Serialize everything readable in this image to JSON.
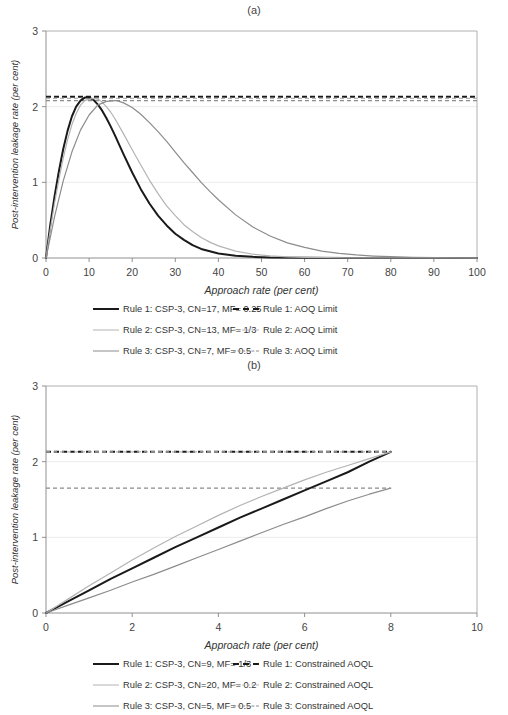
{
  "figure_a": {
    "title": "(a)",
    "chart_data": {
      "type": "line",
      "title": "(a)",
      "xlabel": "Approach rate (per cent)",
      "ylabel": "Post-intervention leakage rate (per cent)",
      "xlim": [
        0,
        100
      ],
      "ylim": [
        0,
        3
      ],
      "xticks": [
        "0",
        "10",
        "20",
        "30",
        "40",
        "50",
        "60",
        "70",
        "80",
        "90",
        "100"
      ],
      "yticks": [
        "0",
        "1",
        "2",
        "3"
      ],
      "grid": "horizontal-major",
      "legend_position": "below",
      "series": [
        {
          "name": "Rule 1: CSP-3, CN=17, MF= 0.25",
          "style": "solid",
          "color": "#1a1a1a",
          "width": 2.0,
          "peak_x": 9.5,
          "peak_y": 2.12,
          "x": [
            0,
            1,
            2,
            3,
            4,
            5,
            6,
            7,
            8,
            9,
            9.5,
            10,
            11,
            12,
            13,
            14,
            15,
            16,
            18,
            20,
            22,
            24,
            26,
            28,
            30,
            32,
            34,
            36,
            38,
            40,
            44,
            48,
            52,
            60,
            70,
            80,
            90,
            100
          ],
          "y": [
            0,
            0.44,
            0.82,
            1.15,
            1.44,
            1.68,
            1.87,
            2.0,
            2.08,
            2.12,
            2.12,
            2.12,
            2.09,
            2.03,
            1.95,
            1.85,
            1.74,
            1.62,
            1.37,
            1.13,
            0.91,
            0.72,
            0.56,
            0.43,
            0.32,
            0.24,
            0.17,
            0.12,
            0.09,
            0.06,
            0.03,
            0.015,
            0.007,
            0.002,
            0.001,
            0.0004,
            0.0002,
            0.0001
          ]
        },
        {
          "name": "Rule 2: CSP-3, CN=13, MF= 1/3",
          "style": "solid",
          "color": "#b3b3b3",
          "width": 1.2,
          "peak_x": 12,
          "peak_y": 2.1,
          "x": [
            0,
            1,
            2,
            3,
            4,
            5,
            6,
            7,
            8,
            9,
            10,
            11,
            12,
            13,
            14,
            15,
            16,
            18,
            20,
            22,
            24,
            26,
            28,
            30,
            32,
            34,
            36,
            38,
            40,
            44,
            48,
            52,
            56,
            60,
            65,
            70,
            80,
            90,
            100
          ],
          "y": [
            0,
            0.38,
            0.73,
            1.04,
            1.32,
            1.56,
            1.76,
            1.91,
            2.02,
            2.08,
            2.1,
            2.11,
            2.1,
            2.06,
            2.0,
            1.93,
            1.84,
            1.64,
            1.43,
            1.23,
            1.03,
            0.85,
            0.69,
            0.56,
            0.44,
            0.35,
            0.27,
            0.21,
            0.16,
            0.09,
            0.05,
            0.027,
            0.014,
            0.008,
            0.004,
            0.002,
            0.0006,
            0.0002,
            0.0001
          ]
        },
        {
          "name": "Rule 3: CSP-3, CN=7, MF= 0.5",
          "style": "solid",
          "color": "#8c8c8c",
          "width": 1.2,
          "peak_x": 16.5,
          "peak_y": 2.08,
          "x": [
            0,
            2,
            4,
            6,
            8,
            10,
            12,
            14,
            16,
            16.5,
            18,
            20,
            22,
            24,
            26,
            28,
            30,
            32,
            34,
            36,
            38,
            40,
            44,
            48,
            52,
            56,
            60,
            64,
            68,
            72,
            76,
            80,
            85,
            90,
            95,
            100
          ],
          "y": [
            0,
            0.55,
            1.02,
            1.4,
            1.69,
            1.89,
            2.02,
            2.07,
            2.08,
            2.08,
            2.05,
            1.99,
            1.9,
            1.79,
            1.67,
            1.54,
            1.4,
            1.26,
            1.13,
            1.0,
            0.88,
            0.77,
            0.57,
            0.41,
            0.29,
            0.2,
            0.14,
            0.09,
            0.06,
            0.04,
            0.026,
            0.017,
            0.009,
            0.005,
            0.003,
            0.0015
          ]
        }
      ],
      "hlines": [
        {
          "name": "Rule 1: AOQ Limit",
          "value": 2.13,
          "style": "dashed",
          "color": "#1a1a1a",
          "width": 2.0
        },
        {
          "name": "Rule 2: AOQ Limit",
          "value": 2.11,
          "style": "dashed",
          "color": "#b3b3b3",
          "width": 1.2
        },
        {
          "name": "Rule 3: AOQ Limit",
          "value": 2.08,
          "style": "dashed",
          "color": "#8c8c8c",
          "width": 1.2
        }
      ]
    },
    "legend": [
      {
        "label": "Rule 1: CSP-3, CN=17, MF= 0.25",
        "style": "solid",
        "color": "#1a1a1a",
        "width": 2.0
      },
      {
        "label": "Rule 1: AOQ Limit",
        "style": "dashed",
        "color": "#1a1a1a",
        "width": 2.0
      },
      {
        "label": "Rule 2: CSP-3, CN=13, MF= 1/3",
        "style": "solid",
        "color": "#b3b3b3",
        "width": 1.2
      },
      {
        "label": "Rule 2: AOQ Limit",
        "style": "dashed",
        "color": "#b3b3b3",
        "width": 1.2
      },
      {
        "label": "Rule 3: CSP-3, CN=7, MF= 0.5",
        "style": "solid",
        "color": "#8c8c8c",
        "width": 1.2
      },
      {
        "label": "Rule 3: AOQ Limit",
        "style": "dashed",
        "color": "#8c8c8c",
        "width": 1.2
      }
    ]
  },
  "figure_b": {
    "title": "(b)",
    "chart_data": {
      "type": "line",
      "title": "(b)",
      "xlabel": "Approach rate (per cent)",
      "ylabel": "Post-intervention leakage rate (per cent)",
      "xlim": [
        0,
        10
      ],
      "ylim": [
        0,
        3
      ],
      "xticks": [
        "0",
        "2",
        "4",
        "6",
        "8",
        "10"
      ],
      "yticks": [
        "0",
        "1",
        "2",
        "3"
      ],
      "grid": "horizontal-major",
      "legend_position": "below",
      "series": [
        {
          "name": "Rule 1: CSP-3, CN=9, MF= 1/3",
          "style": "solid",
          "color": "#1a1a1a",
          "width": 2.0,
          "x": [
            0,
            0.5,
            1,
            1.5,
            2,
            2.5,
            3,
            3.5,
            4,
            4.5,
            5,
            5.5,
            6,
            6.5,
            7,
            7.5,
            8
          ],
          "y": [
            0,
            0.15,
            0.3,
            0.45,
            0.59,
            0.73,
            0.87,
            1.0,
            1.13,
            1.26,
            1.38,
            1.5,
            1.62,
            1.74,
            1.86,
            2.0,
            2.13
          ]
        },
        {
          "name": "Rule 2: CSP-3, CN=20, MF= 0.2",
          "style": "solid",
          "color": "#b3b3b3",
          "width": 1.2,
          "x": [
            0,
            0.5,
            1,
            1.5,
            2,
            2.5,
            3,
            3.5,
            4,
            4.5,
            5,
            5.5,
            6,
            6.5,
            7,
            7.5,
            8
          ],
          "y": [
            0,
            0.18,
            0.36,
            0.53,
            0.7,
            0.86,
            1.01,
            1.15,
            1.29,
            1.42,
            1.54,
            1.65,
            1.76,
            1.86,
            1.95,
            2.04,
            2.13
          ]
        },
        {
          "name": "Rule 3: CSP-3, CN=5, MF= 0.5",
          "style": "solid",
          "color": "#8c8c8c",
          "width": 1.2,
          "x": [
            0,
            0.5,
            1,
            1.5,
            2,
            2.5,
            3,
            3.5,
            4,
            4.5,
            5,
            5.5,
            6,
            6.5,
            7,
            7.5,
            8
          ],
          "y": [
            0,
            0.1,
            0.2,
            0.3,
            0.41,
            0.51,
            0.62,
            0.73,
            0.84,
            0.95,
            1.06,
            1.17,
            1.27,
            1.38,
            1.48,
            1.57,
            1.65
          ]
        }
      ],
      "hlines": [
        {
          "name": "Rule 1: Constrained AOQL",
          "value": 2.13,
          "style": "dashed",
          "color": "#1a1a1a",
          "width": 2.0,
          "x_end": 8
        },
        {
          "name": "Rule 2: Constrained AOQL",
          "value": 2.13,
          "style": "dashed",
          "color": "#b3b3b3",
          "width": 1.2,
          "x_end": 8
        },
        {
          "name": "Rule 3: Constrained AOQL",
          "value": 1.65,
          "style": "dashed",
          "color": "#8c8c8c",
          "width": 1.2,
          "x_end": 8
        }
      ]
    },
    "legend": [
      {
        "label": "Rule 1: CSP-3, CN=9, MF= 1/3",
        "style": "solid",
        "color": "#1a1a1a",
        "width": 2.0
      },
      {
        "label": "Rule 1: Constrained AOQL",
        "style": "dashed",
        "color": "#1a1a1a",
        "width": 2.0
      },
      {
        "label": "Rule 2: CSP-3, CN=20, MF= 0.2",
        "style": "solid",
        "color": "#b3b3b3",
        "width": 1.2
      },
      {
        "label": "Rule 2: Constrained AOQL",
        "style": "dashed",
        "color": "#b3b3b3",
        "width": 1.2
      },
      {
        "label": "Rule 3: CSP-3, CN=5, MF= 0.5",
        "style": "solid",
        "color": "#8c8c8c",
        "width": 1.2
      },
      {
        "label": "Rule 3: Constrained AOQL",
        "style": "dashed",
        "color": "#8c8c8c",
        "width": 1.2
      }
    ]
  }
}
